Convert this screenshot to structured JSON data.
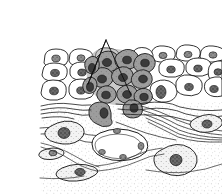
{
  "figure": {
    "panel_label": "(c)",
    "callout_label": "Invasive tumor cells",
    "background_color": "#ffffff",
    "ink_color": "#111111"
  },
  "annotations": {
    "leader_apex": {
      "x": 106,
      "y": 40
    },
    "leader_targets": [
      {
        "x": 88,
        "y": 84,
        "description": "tumor cells at left of invasive front"
      },
      {
        "x": 131,
        "y": 95,
        "description": "tumor cells at right of invasive front"
      }
    ]
  },
  "regions": [
    {
      "name": "epithelium",
      "description": "stratified layer of normal unfilled epithelial cells across the top",
      "fill": "#ffffff",
      "outline": "#111111"
    },
    {
      "name": "tumor-mass",
      "description": "wedge of gray shaded pleomorphic tumor cells in the center of the epithelium",
      "fill": "#9a9a9a",
      "outline": "#111111"
    },
    {
      "name": "basement-membrane",
      "description": "wavy parallel lines beneath the epithelium, breached at center",
      "outline": "#111111"
    },
    {
      "name": "stroma",
      "description": "stippled connective tissue below the basement membrane",
      "fill": "#fdfdfd",
      "stipple": "#b8b8b8"
    },
    {
      "name": "collagen-fibers",
      "description": "sweeping bundles of wavy parallel fibers in the stroma on the right",
      "outline": "#222222"
    },
    {
      "name": "blood-vessel",
      "description": "oval vessel lumen lined by endothelial nuclei in the lower center",
      "outline": "#111111"
    },
    {
      "name": "fibroblasts",
      "description": "stellate and spindle shaped stromal cells with stippled cytoplasm",
      "fill": "#f4f4f4",
      "outline": "#111111"
    }
  ],
  "colors": {
    "tumor_cytoplasm": "#9a9a9a",
    "tumor_nucleus": "#3a3a3a",
    "normal_cytoplasm": "#ffffff",
    "normal_nucleus": "#5a5a5a",
    "stroma_stipple": "#b8b8b8",
    "outline": "#111111"
  },
  "counts": {
    "normal_epithelial_cells_visible": 34,
    "tumor_cells_visible": 17,
    "stromal_fibroblasts_visible": 5,
    "blood_vessels_visible": 1,
    "leader_lines": 2
  }
}
